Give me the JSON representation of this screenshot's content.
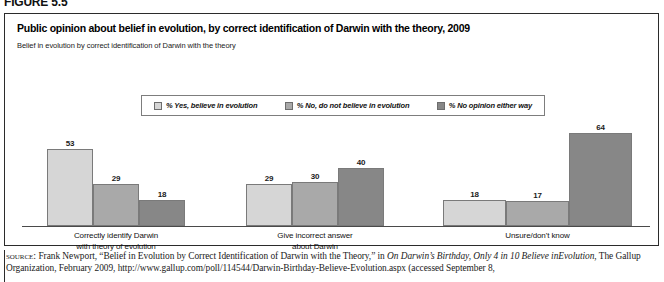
{
  "figure": {
    "number": "FIGURE 5.5"
  },
  "chart": {
    "title": "Public opinion about belief in evolution, by correct identification of Darwin with the theory, 2009",
    "subtitle": "Belief in evolution by correct identification of Darwin with the theory"
  },
  "legend": {
    "items": [
      {
        "label": "% Yes, believe in evolution",
        "color": "#d6d6d6"
      },
      {
        "label": "% No, do not believe in evolution",
        "color": "#a9a9a9"
      },
      {
        "label": "% No opinion either way",
        "color": "#878787"
      }
    ]
  },
  "source": {
    "label": "source:",
    "line1_a": "Frank Newport, “Belief in Evolution by Correct Identification of Darwin with the Theory,” in ",
    "line1_italic": "On Darwin’s Birthday, Only 4 in 10 Believe in",
    "line2_italic": "Evolution",
    "line2_b": ", The Gallup Organization, February 2009, http://www.gallup.com/poll/114544/Darwin-Birthday-Believe-Evolution.aspx (accessed September 8,"
  },
  "chart_data": {
    "type": "bar",
    "title": "Public opinion about belief in evolution, by correct identification of Darwin with the theory, 2009",
    "subtitle": "Belief in evolution by correct identification of Darwin with the theory",
    "xlabel": "",
    "ylabel": "",
    "ylim": [
      0,
      70
    ],
    "grid": false,
    "legend_position": "top-center",
    "value_labels": true,
    "categories": [
      "Correctly identify Darwin with theory of evolution",
      "Give incorrect answer about Darwin",
      "Unsure/don't know"
    ],
    "categories_lines": [
      [
        "Correctly identify Darwin",
        "with theory of evolution"
      ],
      [
        "Give incorrect answer",
        "about Darwin"
      ],
      [
        "Unsure/don't know"
      ]
    ],
    "series": [
      {
        "name": "% Yes, believe in evolution",
        "color": "#d6d6d6",
        "values": [
          53,
          29,
          18
        ]
      },
      {
        "name": "% No, do not believe in evolution",
        "color": "#a9a9a9",
        "values": [
          29,
          30,
          17
        ]
      },
      {
        "name": "% No opinion either way",
        "color": "#878787",
        "values": [
          18,
          40,
          64
        ]
      }
    ]
  }
}
